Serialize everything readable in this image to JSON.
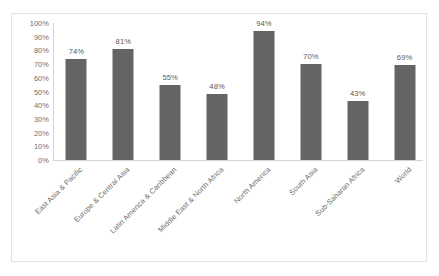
{
  "chart_data": {
    "type": "bar",
    "title": "",
    "subtitle": "",
    "xlabel": "",
    "ylabel": "",
    "categories": [
      "East Asia & Pacific",
      "Europe & Central Asia",
      "Latin America & Caribbean",
      "Middle East & North Africa",
      "North America",
      "South Asia",
      "Sub-Saharan Africa",
      "World"
    ],
    "values": [
      74,
      81,
      55,
      48,
      94,
      70,
      43,
      69
    ],
    "data_labels": [
      "74%",
      "81%",
      "55%",
      "48%",
      "94%",
      "70%",
      "43%",
      "69%"
    ],
    "ylim": [
      0,
      100
    ],
    "ytick_values": [
      100,
      90,
      80,
      70,
      60,
      50,
      40,
      30,
      20,
      10,
      0
    ],
    "ytick_labels": [
      "100%",
      "90%",
      "80%",
      "70%",
      "60%",
      "50%",
      "40%",
      "30%",
      "20%",
      "10%",
      "0%"
    ],
    "grid": false,
    "legend": false,
    "bar_color": "#646464",
    "axis_color": "#d4d4d4",
    "text_color": "#6e6e6e",
    "border_color": "#e3e3e3",
    "background_color": "#ffffff"
  }
}
